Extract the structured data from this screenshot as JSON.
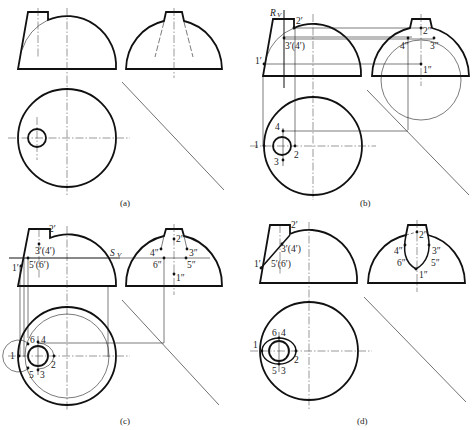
{
  "figure": {
    "panels": [
      {
        "id": "a",
        "caption": "(a)",
        "views": [
          "front",
          "side",
          "top"
        ],
        "labels": []
      },
      {
        "id": "b",
        "caption": "(b)",
        "plane_label": "R",
        "plane_sub": "V",
        "front_labels": [
          "1′",
          "2′",
          "3′(4′)"
        ],
        "side_labels": [
          "1″",
          "2″",
          "3″",
          "4″"
        ],
        "top_labels": [
          "1",
          "2",
          "3",
          "4"
        ]
      },
      {
        "id": "c",
        "caption": "(c)",
        "plane_label": "S",
        "plane_sub": "V",
        "front_labels": [
          "1′",
          "2′",
          "3′(4′)",
          "5′(6′)"
        ],
        "side_labels": [
          "1″",
          "2″",
          "3″",
          "4″",
          "5″",
          "6″"
        ],
        "top_labels": [
          "1",
          "2",
          "3",
          "4",
          "5",
          "6"
        ]
      },
      {
        "id": "d",
        "caption": "(d)",
        "front_labels": [
          "1′",
          "2′",
          "3′(4′)",
          "5′(6′)"
        ],
        "side_labels": [
          "1″",
          "2″",
          "3″",
          "4″",
          "5″",
          "6″"
        ],
        "top_labels": [
          "1",
          "2",
          "3",
          "4",
          "5",
          "6"
        ]
      }
    ]
  },
  "labels": {
    "a_cap": "(a)",
    "b_cap": "(b)",
    "c_cap": "(c)",
    "d_cap": "(d)",
    "b_R": "R",
    "b_Rsub": "V",
    "c_S": "S",
    "c_Ssub": "V",
    "p1f": "1′",
    "p2f": "2′",
    "p34f": "3′(4′)",
    "p56f": "5′(6′)",
    "p1s": "1″",
    "p2s": "2″",
    "p3s": "3″",
    "p4s": "4″",
    "p5s": "5″",
    "p6s": "6″",
    "t1": "1",
    "t2": "2",
    "t3": "3",
    "t4": "4",
    "t5": "5",
    "t6": "6"
  }
}
